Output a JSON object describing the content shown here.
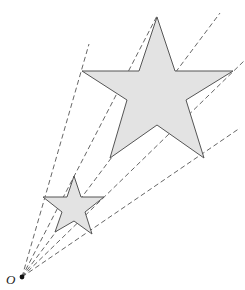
{
  "diagram": {
    "title": "",
    "type": "enlargement",
    "center_label": "O",
    "shapes": [
      {
        "name": "small-star",
        "kind": "five-pointed star",
        "role": "object"
      },
      {
        "name": "large-star",
        "kind": "five-pointed star",
        "role": "image"
      }
    ],
    "ray_count": 5,
    "colors": {
      "star_fill": "#e3e3e3",
      "stroke": "#555555"
    }
  }
}
